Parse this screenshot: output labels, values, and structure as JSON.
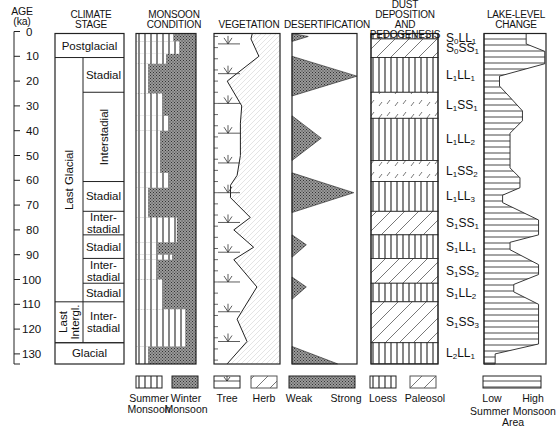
{
  "axis": {
    "title": "AGE",
    "unit": "(ka)",
    "ticks": [
      "0",
      "10",
      "20",
      "30",
      "40",
      "50",
      "60",
      "70",
      "80",
      "90",
      "100",
      "110",
      "120",
      "130"
    ]
  },
  "headers": {
    "climate": [
      "CLIMATE",
      "STAGE"
    ],
    "monsoon": [
      "MONSOON",
      "CONDITION"
    ],
    "vegetation": [
      "VEGETATION"
    ],
    "desertification": [
      "DESERTIFICATION"
    ],
    "dust": [
      "DUST DEPOSITION",
      "AND",
      "PEDOGENESIS"
    ],
    "lake": [
      "LAKE-LEVEL",
      "CHANGE"
    ]
  },
  "climate_stage": {
    "outer": [
      {
        "label": "Postglacial",
        "from": 0,
        "to": 10.5,
        "orient": "h"
      },
      {
        "label": "Last Glacial",
        "from": 10.5,
        "to": 109,
        "orient": "v"
      },
      {
        "label": "Last Intergl.",
        "from": 109,
        "to": 125.5,
        "orient": "v"
      },
      {
        "label": "Glacial",
        "from": 125.5,
        "to": 134,
        "orient": "h"
      }
    ],
    "inner": [
      {
        "label": "Stadial",
        "from": 10.5,
        "to": 24.5,
        "orient": "h"
      },
      {
        "label": "Interstadial",
        "from": 24.5,
        "to": 60.5,
        "orient": "v"
      },
      {
        "label": "Stadial",
        "from": 60.5,
        "to": 72.5,
        "orient": "h"
      },
      {
        "label": "Inter-\nstadial",
        "from": 72.5,
        "to": 82,
        "orient": "h"
      },
      {
        "label": "Stadial",
        "from": 82,
        "to": 91.5,
        "orient": "h"
      },
      {
        "label": "Inter-\nstadial",
        "from": 91.5,
        "to": 101.5,
        "orient": "h"
      },
      {
        "label": "Stadial",
        "from": 101.5,
        "to": 109,
        "orient": "h"
      },
      {
        "label": "Inter-\nstadial",
        "from": 109,
        "to": 125.5,
        "orient": "h"
      }
    ]
  },
  "chart_data": {
    "type": "stratigraphic-column",
    "ylabel": "AGE (ka)",
    "ylim": [
      0,
      134
    ],
    "monsoon_summer_fraction": [
      {
        "from": 0,
        "to": 4,
        "frac": 0.62
      },
      {
        "from": 4,
        "to": 9,
        "frac": 0.72
      },
      {
        "from": 9,
        "to": 13,
        "frac": 0.5
      },
      {
        "from": 13,
        "to": 25,
        "frac": 0.2
      },
      {
        "from": 25,
        "to": 34,
        "frac": 0.45
      },
      {
        "from": 34,
        "to": 40,
        "frac": 0.55
      },
      {
        "from": 40,
        "to": 57,
        "frac": 0.4
      },
      {
        "from": 57,
        "to": 63,
        "frac": 0.55
      },
      {
        "from": 63,
        "to": 75,
        "frac": 0.2
      },
      {
        "from": 75,
        "to": 85,
        "frac": 0.68
      },
      {
        "from": 85,
        "to": 90,
        "frac": 0.35
      },
      {
        "from": 90,
        "to": 92,
        "frac": 0.6
      },
      {
        "from": 92,
        "to": 100,
        "frac": 0.35
      },
      {
        "from": 100,
        "to": 112,
        "frac": 0.45
      },
      {
        "from": 112,
        "to": 127,
        "frac": 0.82
      },
      {
        "from": 127,
        "to": 134,
        "frac": 0.2
      }
    ],
    "vegetation_tree_fraction": [
      {
        "age": 0,
        "frac": 0.58
      },
      {
        "age": 3,
        "frac": 0.56
      },
      {
        "age": 10,
        "frac": 0.68
      },
      {
        "age": 20,
        "frac": 0.2
      },
      {
        "age": 30,
        "frac": 0.42
      },
      {
        "age": 37,
        "frac": 0.4
      },
      {
        "age": 50,
        "frac": 0.4
      },
      {
        "age": 58,
        "frac": 0.35
      },
      {
        "age": 62,
        "frac": 0.25
      },
      {
        "age": 67,
        "frac": 0.25
      },
      {
        "age": 75,
        "frac": 0.55
      },
      {
        "age": 80,
        "frac": 0.3
      },
      {
        "age": 87,
        "frac": 0.6
      },
      {
        "age": 92,
        "frac": 0.3
      },
      {
        "age": 103,
        "frac": 0.65
      },
      {
        "age": 116,
        "frac": 0.35
      },
      {
        "age": 125,
        "frac": 0.5
      },
      {
        "age": 134,
        "frac": 0.2
      }
    ],
    "desertification_peaks": [
      {
        "from": 0,
        "peak_age": 2,
        "to": 4,
        "strength": 0.25
      },
      {
        "from": 10,
        "peak_age": 18,
        "to": 26,
        "strength": 1.0
      },
      {
        "from": 34,
        "peak_age": 43,
        "to": 52,
        "strength": 0.45
      },
      {
        "from": 57,
        "peak_age": 65,
        "to": 73,
        "strength": 0.95
      },
      {
        "from": 82,
        "peak_age": 86,
        "to": 91,
        "strength": 0.22
      },
      {
        "from": 99,
        "peak_age": 103,
        "to": 108,
        "strength": 0.22
      },
      {
        "from": 127,
        "peak_age": 134,
        "to": 134,
        "strength": 0.7
      }
    ],
    "dust_units": [
      {
        "label": "S0LL1",
        "main": "S",
        "sub1": "0",
        "mid": "LL",
        "sub2": "1",
        "type": "loess",
        "from": 0,
        "to": 3
      },
      {
        "label": "S0SS1",
        "main": "S",
        "sub1": "0",
        "mid": "SS",
        "sub2": "1",
        "type": "paleosol",
        "from": 3,
        "to": 10.5
      },
      {
        "label": "L1LL1",
        "main": "L",
        "sub1": "1",
        "mid": "LL",
        "sub2": "1",
        "type": "loess",
        "from": 10.5,
        "to": 24.5
      },
      {
        "label": "L1SS1",
        "main": "L",
        "sub1": "1",
        "mid": "SS",
        "sub2": "1",
        "type": "paleosol-faint",
        "from": 24.5,
        "to": 35
      },
      {
        "label": "L1LL2",
        "main": "L",
        "sub1": "1",
        "mid": "LL",
        "sub2": "2",
        "type": "loess",
        "from": 35,
        "to": 52
      },
      {
        "label": "L1SS2",
        "main": "L",
        "sub1": "1",
        "mid": "SS",
        "sub2": "2",
        "type": "paleosol-faint",
        "from": 52,
        "to": 60.5
      },
      {
        "label": "L1LL3",
        "main": "L",
        "sub1": "1",
        "mid": "LL",
        "sub2": "3",
        "type": "loess",
        "from": 60.5,
        "to": 72.5
      },
      {
        "label": "S1SS1",
        "main": "S",
        "sub1": "1",
        "mid": "SS",
        "sub2": "1",
        "type": "paleosol",
        "from": 72.5,
        "to": 82
      },
      {
        "label": "S1LL1",
        "main": "S",
        "sub1": "1",
        "mid": "LL",
        "sub2": "1",
        "type": "loess",
        "from": 82,
        "to": 91.5
      },
      {
        "label": "S1SS2",
        "main": "S",
        "sub1": "1",
        "mid": "SS",
        "sub2": "2",
        "type": "paleosol",
        "from": 91.5,
        "to": 101.5
      },
      {
        "label": "S1LL2",
        "main": "S",
        "sub1": "1",
        "mid": "LL",
        "sub2": "2",
        "type": "loess",
        "from": 101.5,
        "to": 109
      },
      {
        "label": "S1SS3",
        "main": "S",
        "sub1": "1",
        "mid": "SS",
        "sub2": "3",
        "type": "paleosol",
        "from": 109,
        "to": 125.5
      },
      {
        "label": "L2LL1",
        "main": "L",
        "sub1": "2",
        "mid": "LL",
        "sub2": "1",
        "type": "loess",
        "from": 125.5,
        "to": 134
      }
    ],
    "lake_level_fraction": [
      {
        "age": 0,
        "frac": 0.68
      },
      {
        "age": 5,
        "frac": 0.68
      },
      {
        "age": 8,
        "frac": 0.98
      },
      {
        "age": 13,
        "frac": 0.98
      },
      {
        "age": 18,
        "frac": 0.25
      },
      {
        "age": 22,
        "frac": 0.25
      },
      {
        "age": 26,
        "frac": 0.4
      },
      {
        "age": 32,
        "frac": 0.62
      },
      {
        "age": 36,
        "frac": 0.62
      },
      {
        "age": 41,
        "frac": 0.42
      },
      {
        "age": 55,
        "frac": 0.42
      },
      {
        "age": 59,
        "frac": 0.58
      },
      {
        "age": 63,
        "frac": 0.58
      },
      {
        "age": 66,
        "frac": 0.3
      },
      {
        "age": 69,
        "frac": 0.3
      },
      {
        "age": 76,
        "frac": 0.88
      },
      {
        "age": 82,
        "frac": 0.88
      },
      {
        "age": 85,
        "frac": 0.42
      },
      {
        "age": 88,
        "frac": 0.42
      },
      {
        "age": 94,
        "frac": 0.88
      },
      {
        "age": 98,
        "frac": 0.88
      },
      {
        "age": 102,
        "frac": 0.48
      },
      {
        "age": 105,
        "frac": 0.48
      },
      {
        "age": 110,
        "frac": 0.88
      },
      {
        "age": 126,
        "frac": 0.88
      },
      {
        "age": 130,
        "frac": 0.18
      },
      {
        "age": 134,
        "frac": 0.18
      }
    ]
  },
  "legend": {
    "summer_monsoon": [
      "Summer",
      "Monsoon"
    ],
    "winter_monsoon": [
      "Winter",
      "Monsoon"
    ],
    "tree": "Tree",
    "herb": "Herb",
    "weak": "Weak",
    "strong": "Strong",
    "loess": "Loess",
    "paleosol": "Paleosol",
    "low": "Low",
    "high": "High",
    "summer_monsoon_area": [
      "Summer Monsoon",
      "Area"
    ]
  }
}
